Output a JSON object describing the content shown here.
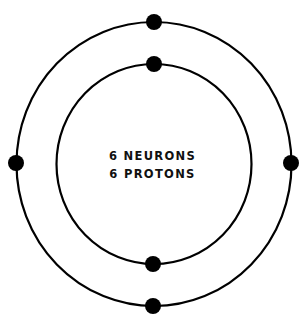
{
  "diagram": {
    "type": "atom-model",
    "labels": {
      "line1": "6 NEURONS",
      "line2": "6 PROTONS"
    },
    "colors": {
      "stroke": "#000000",
      "electron": "#000000",
      "text": "#111111",
      "background": "#ffffff"
    },
    "orbits": [
      {
        "name": "inner",
        "electron_count": 2
      },
      {
        "name": "outer",
        "electron_count": 4
      }
    ]
  }
}
